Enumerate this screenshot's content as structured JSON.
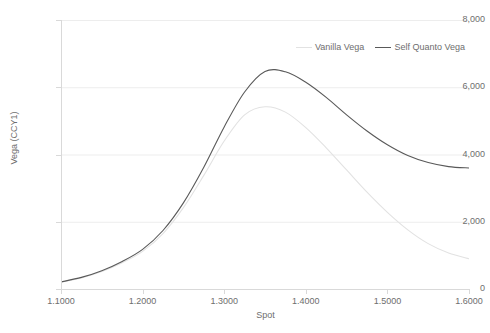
{
  "chart_data": {
    "type": "line",
    "title": "",
    "xlabel": "Spot",
    "ylabel": "Vega (CCY1)",
    "xlim": [
      1.1,
      1.6
    ],
    "ylim": [
      0,
      8000
    ],
    "grid": true,
    "legend_position": "top-right",
    "x_ticks": [
      "1.1000",
      "1.2000",
      "1.3000",
      "1.4000",
      "1.5000",
      "1.6000"
    ],
    "x_tick_values": [
      1.1,
      1.2,
      1.3,
      1.4,
      1.5,
      1.6
    ],
    "y_ticks": [
      "0",
      "2,000",
      "4,000",
      "6,000",
      "8,000"
    ],
    "y_tick_values": [
      0,
      2000,
      4000,
      6000,
      8000
    ],
    "x": [
      1.1,
      1.125,
      1.15,
      1.175,
      1.2,
      1.225,
      1.25,
      1.275,
      1.3,
      1.325,
      1.35,
      1.375,
      1.4,
      1.425,
      1.45,
      1.475,
      1.5,
      1.525,
      1.55,
      1.575,
      1.6
    ],
    "series": [
      {
        "name": "Vanilla Vega",
        "color": "#e2e2e2",
        "values": [
          200,
          330,
          520,
          780,
          1120,
          1650,
          2420,
          3380,
          4400,
          5180,
          5420,
          5260,
          4800,
          4200,
          3540,
          2880,
          2280,
          1760,
          1350,
          1070,
          900
        ]
      },
      {
        "name": "Self Quanto Vega",
        "color": "#595959",
        "values": [
          210,
          345,
          545,
          820,
          1180,
          1740,
          2560,
          3620,
          4820,
          5860,
          6470,
          6460,
          6150,
          5700,
          5180,
          4700,
          4290,
          3970,
          3760,
          3640,
          3600
        ]
      }
    ]
  },
  "legend": {
    "items": [
      {
        "label": "Vanilla Vega"
      },
      {
        "label": "Self Quanto Vega"
      }
    ]
  }
}
